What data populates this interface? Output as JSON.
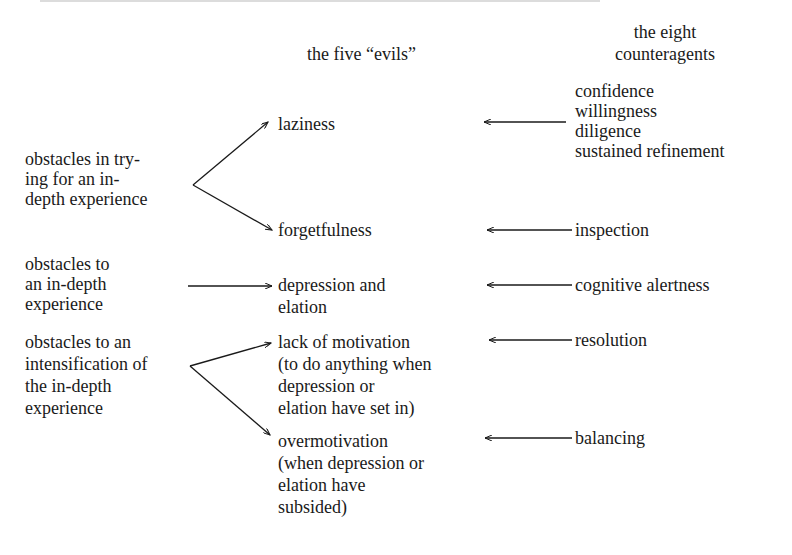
{
  "headers": {
    "evils": "the five “evils”",
    "counteragents_line1": "the eight",
    "counteragents_line2": "counteragents"
  },
  "obstacles": [
    {
      "lines": [
        "obstacles in try-",
        "ing for an in-",
        "depth experience"
      ]
    },
    {
      "lines": [
        "obstacles to",
        "an in-depth",
        "experience"
      ]
    },
    {
      "lines": [
        "obstacles to an",
        "intensification of",
        "the in-depth",
        "experience"
      ]
    }
  ],
  "evils": [
    {
      "lines": [
        "laziness"
      ]
    },
    {
      "lines": [
        "forgetfulness"
      ]
    },
    {
      "lines": [
        "depression and",
        "elation"
      ]
    },
    {
      "lines": [
        "lack of motivation",
        "(to do anything when",
        "depression or",
        "elation have set in)"
      ]
    },
    {
      "lines": [
        "overmotivation",
        "(when depression or",
        "elation have",
        "subsided)"
      ]
    }
  ],
  "counteragents": [
    {
      "lines": [
        "confidence",
        "willingness",
        "diligence",
        "sustained refinement"
      ]
    },
    {
      "lines": [
        "inspection"
      ]
    },
    {
      "lines": [
        "cognitive alertness"
      ]
    },
    {
      "lines": [
        "resolution"
      ]
    },
    {
      "lines": [
        "balancing"
      ]
    }
  ],
  "colors": {
    "ink": "#1a1a1a",
    "background": "#ffffff"
  }
}
